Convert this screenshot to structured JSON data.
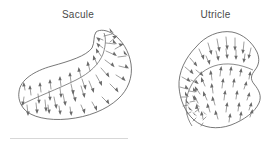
{
  "figure": {
    "type": "anatomical-line-diagram",
    "background_color": "#ffffff",
    "outline_color": "#555555",
    "arrow_color": "#6b6b6b",
    "label_color": "#4a4a4a"
  },
  "panels": [
    {
      "id": "saccule",
      "label": "Sacule",
      "shape": "hook",
      "striola_description": "curved line running along the long axis and around the hook",
      "arrow_count": 46,
      "arrow_direction": "away from striola on both sides"
    },
    {
      "id": "utricle",
      "label": "Utricle",
      "shape": "rounded-blob-with-notch",
      "striola_description": "curved arc sweeping across the upper and left portion",
      "arrow_count": 54,
      "arrow_direction": "toward striola on both sides"
    }
  ],
  "caption_rule": {
    "visible": true,
    "color": "#d7d7d7"
  }
}
